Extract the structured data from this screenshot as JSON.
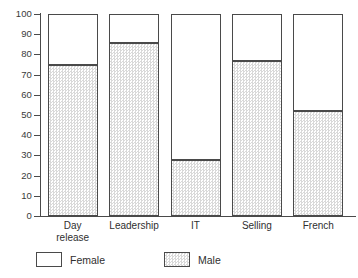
{
  "chart_data": {
    "type": "bar",
    "stacked": true,
    "title": "",
    "subtitle": "",
    "xlabel": "",
    "ylabel": "",
    "ylim": [
      0,
      100
    ],
    "yticks": [
      0,
      10,
      20,
      30,
      40,
      50,
      60,
      70,
      80,
      90,
      100
    ],
    "ytick_labels": [
      "0",
      "10",
      "20",
      "30",
      "40",
      "50",
      "60",
      "70",
      "80",
      "90",
      "100"
    ],
    "grid": false,
    "legend_position": "bottom-left",
    "categories": [
      "Day\nrelease",
      "Leadership",
      "IT",
      "Selling",
      "French"
    ],
    "category_labels": [
      "Day release",
      "Leadership",
      "IT",
      "Selling",
      "French"
    ],
    "series": [
      {
        "name": "Male",
        "values": [
          75,
          85.5,
          27.5,
          76.5,
          52
        ],
        "color": "#e2e2e2",
        "pattern": "stipple"
      },
      {
        "name": "Female",
        "values": [
          25,
          14.5,
          72.5,
          23.5,
          48
        ],
        "color": "#ffffff",
        "pattern": "solid"
      }
    ],
    "stack_order_bottom_to_top": [
      "Male",
      "Female"
    ]
  },
  "legend": {
    "items": [
      {
        "label": "Female",
        "swatch": "white-square-icon"
      },
      {
        "label": "Male",
        "swatch": "stippled-square-icon"
      }
    ]
  }
}
